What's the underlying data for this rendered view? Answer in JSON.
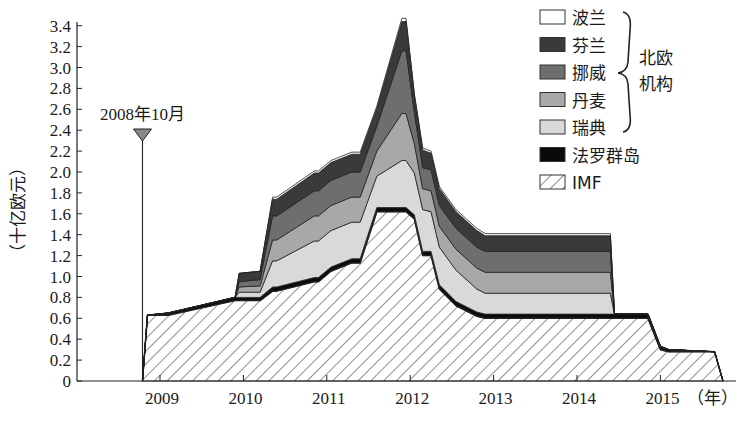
{
  "chart_data": {
    "type": "area",
    "stacked": true,
    "title": "",
    "xlabel": "（年）",
    "ylabel": "（十亿欧元）",
    "ylim": [
      0,
      3.4
    ],
    "yticks": [
      "0",
      "0.2",
      "0.4",
      "0.6",
      "0.8",
      "1.0",
      "1.2",
      "1.4",
      "1.6",
      "1.8",
      "2.0",
      "2.2",
      "2.4",
      "2.6",
      "2.8",
      "3.0",
      "3.2",
      "3.4"
    ],
    "xticks": [
      "2009",
      "2010",
      "2011",
      "2012",
      "2013",
      "2014",
      "2015"
    ],
    "grid": false,
    "legend_position": "top-right",
    "annotation": {
      "label": "2008年10月",
      "x": 2008.79
    },
    "legend_group_label": "北欧\n机构",
    "legend_group_line1": "北欧",
    "legend_group_line2": "机构",
    "x": [
      2008.79,
      2008.85,
      2009.1,
      2009.9,
      2009.95,
      2010.2,
      2010.35,
      2010.4,
      2010.85,
      2010.9,
      2011.05,
      2011.3,
      2011.4,
      2011.6,
      2011.9,
      2011.95,
      2012.05,
      2012.15,
      2012.25,
      2012.35,
      2012.55,
      2012.8,
      2012.9,
      2014.4,
      2014.45,
      2014.75,
      2014.85,
      2015.0,
      2015.1,
      2015.65,
      2015.75
    ],
    "series": [
      {
        "name": "IMF",
        "color": "#ffffff",
        "pattern": "hatch",
        "values": [
          0,
          0.63,
          0.63,
          0.77,
          0.77,
          0.77,
          0.86,
          0.86,
          0.95,
          0.95,
          1.05,
          1.13,
          1.13,
          1.62,
          1.62,
          1.62,
          1.55,
          1.2,
          1.2,
          0.88,
          0.72,
          0.62,
          0.6,
          0.6,
          0.6,
          0.6,
          0.6,
          0.3,
          0.28,
          0.28,
          0
        ]
      },
      {
        "name": "法罗群岛",
        "color": "#0a0a0a",
        "values": [
          0,
          0,
          0.02,
          0.03,
          0.03,
          0.03,
          0.04,
          0.04,
          0.04,
          0.04,
          0.04,
          0.04,
          0.04,
          0.04,
          0.04,
          0.04,
          0.04,
          0.04,
          0.04,
          0.04,
          0.04,
          0.04,
          0.04,
          0.04,
          0.04,
          0.04,
          0.04,
          0.03,
          0.02,
          0,
          0
        ]
      },
      {
        "name": "瑞典",
        "color": "#d9d9d9",
        "values": [
          0,
          0,
          0,
          0,
          0.05,
          0.05,
          0.25,
          0.25,
          0.35,
          0.35,
          0.35,
          0.35,
          0.35,
          0.3,
          0.45,
          0.45,
          0.4,
          0.4,
          0.38,
          0.36,
          0.3,
          0.22,
          0.2,
          0.2,
          0,
          0,
          0,
          0,
          0,
          0,
          0
        ]
      },
      {
        "name": "丹麦",
        "color": "#a8a8a8",
        "values": [
          0,
          0,
          0,
          0,
          0.05,
          0.06,
          0.2,
          0.2,
          0.24,
          0.24,
          0.24,
          0.24,
          0.24,
          0.24,
          0.45,
          0.45,
          0.28,
          0.2,
          0.2,
          0.2,
          0.2,
          0.2,
          0.2,
          0.2,
          0,
          0,
          0,
          0,
          0,
          0,
          0
        ]
      },
      {
        "name": "挪威",
        "color": "#6e6e6e",
        "values": [
          0,
          0,
          0,
          0,
          0.05,
          0.06,
          0.23,
          0.23,
          0.24,
          0.24,
          0.24,
          0.24,
          0.24,
          0.24,
          0.6,
          0.6,
          0.3,
          0.2,
          0.2,
          0.2,
          0.2,
          0.2,
          0.2,
          0.2,
          0,
          0,
          0,
          0,
          0,
          0,
          0
        ]
      },
      {
        "name": "芬兰",
        "color": "#3a3a3a",
        "values": [
          0,
          0,
          0,
          0,
          0.08,
          0.08,
          0.16,
          0.16,
          0.17,
          0.17,
          0.17,
          0.17,
          0.17,
          0.17,
          0.28,
          0.28,
          0.16,
          0.17,
          0.16,
          0.16,
          0.16,
          0.16,
          0.15,
          0.15,
          0,
          0,
          0,
          0,
          0,
          0,
          0
        ]
      },
      {
        "name": "波兰",
        "color": "#ffffff",
        "values": [
          0,
          0,
          0,
          0,
          0,
          0,
          0.02,
          0.02,
          0.02,
          0.02,
          0.02,
          0.02,
          0.02,
          0.02,
          0.03,
          0.03,
          0.02,
          0.02,
          0.02,
          0.02,
          0.02,
          0.02,
          0.02,
          0.02,
          0,
          0,
          0,
          0,
          0,
          0,
          0
        ]
      }
    ]
  },
  "legend": {
    "items": [
      {
        "label": "波兰",
        "color": "#ffffff"
      },
      {
        "label": "芬兰",
        "color": "#3a3a3a"
      },
      {
        "label": "挪威",
        "color": "#6e6e6e"
      },
      {
        "label": "丹麦",
        "color": "#a8a8a8"
      },
      {
        "label": "瑞典",
        "color": "#d9d9d9"
      },
      {
        "label": "法罗群岛",
        "color": "#0a0a0a"
      },
      {
        "label": "IMF",
        "color": "#ffffff"
      }
    ]
  }
}
